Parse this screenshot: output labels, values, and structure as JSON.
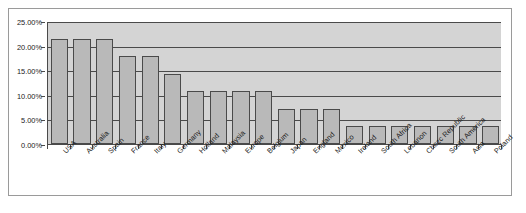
{
  "chart_data": {
    "type": "bar",
    "title": "",
    "xlabel": "",
    "ylabel": "",
    "ylim": [
      0,
      25
    ],
    "y_ticks": [
      "0.00%",
      "5.00%",
      "10.00%",
      "15.00%",
      "20.00%",
      "25.00%"
    ],
    "y_tick_values": [
      0,
      5,
      10,
      15,
      20,
      25
    ],
    "grid": true,
    "legend": "none",
    "categories": [
      "USA",
      "Australia",
      "Spain",
      "France",
      "Italy",
      "Germany",
      "Holland",
      "Malaysia",
      "Europe",
      "Belgium",
      "Japan",
      "England",
      "Mexico",
      "Ireland",
      "South Africa",
      "Lebanon",
      "Chezc Republic",
      "South America",
      "Asia",
      "Poland"
    ],
    "values": [
      21.4,
      21.4,
      21.4,
      17.9,
      17.9,
      14.3,
      10.7,
      10.7,
      10.7,
      10.7,
      7.1,
      7.1,
      7.1,
      3.6,
      3.6,
      3.6,
      3.6,
      3.6,
      3.6,
      3.6
    ],
    "value_labels": [
      "21.4%",
      "21.4%",
      "21.4%",
      "17.9%",
      "17.9%",
      "14.3%",
      "10.7%",
      "10.7%",
      "10.7%",
      "10.7%",
      "7.1%",
      "7.1%",
      "7.1%",
      "3.6%",
      "3.6%",
      "3.6%",
      "3.6%",
      "3.6%",
      "3.6%",
      "3.6%"
    ]
  },
  "style": {
    "bar_fill": "#b9b9b9",
    "bar_border": "#4a4a4a",
    "plot_background": "#d4d4d4",
    "gridline_color": "#4a4a4a",
    "frame_border": "#9a9a9a",
    "text_color": "#1a1a1a"
  }
}
